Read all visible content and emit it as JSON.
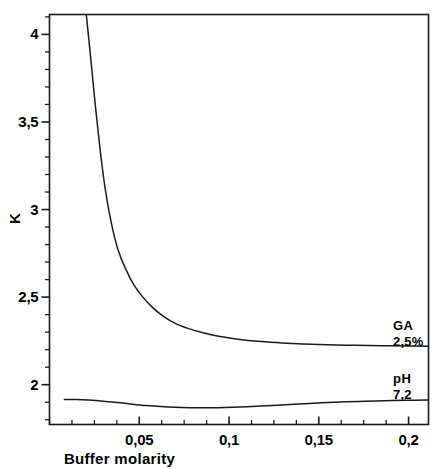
{
  "chart_data": {
    "type": "line",
    "title": "",
    "xlabel": "Buffer molarity",
    "ylabel": "K",
    "xlim": [
      0.0,
      0.2111
    ],
    "ylim": [
      1.7727,
      4.1136
    ],
    "xticks": [
      0.05,
      0.1,
      0.15,
      0.2
    ],
    "xtick_labels": [
      "0,05",
      "0,1",
      "0,15",
      "0,2"
    ],
    "yticks": [
      2,
      2.5,
      3,
      3.5,
      4
    ],
    "ytick_labels": [
      "2",
      "2,5",
      "3",
      "3,5",
      "4"
    ],
    "x_minor_tick_step": 0.0125,
    "y_minor_tick_step": 0.1,
    "grid": false,
    "legend_position": "inline-right-annotations",
    "decimal_separator": ",",
    "frame": "box",
    "line_color": "#1a1a1a",
    "series": [
      {
        "name": "GA 2,5%",
        "annotation_line1": "GA",
        "annotation_line2": "2,5%",
        "x": [
          0.0148,
          0.0165,
          0.0185,
          0.0205,
          0.0225,
          0.025,
          0.028,
          0.031,
          0.0345,
          0.0385,
          0.0425,
          0.047,
          0.052,
          0.0575,
          0.0635,
          0.07,
          0.0775,
          0.086,
          0.095,
          0.105,
          0.116,
          0.128,
          0.141,
          0.155,
          0.17,
          0.185,
          0.2,
          0.2111
        ],
        "y": [
          4.65,
          4.49,
          4.32,
          4.1136,
          3.91,
          3.65,
          3.36,
          3.12,
          2.92,
          2.76,
          2.66,
          2.57,
          2.5,
          2.44,
          2.39,
          2.35,
          2.32,
          2.295,
          2.275,
          2.26,
          2.248,
          2.24,
          2.233,
          2.228,
          2.225,
          2.223,
          2.221,
          2.22
        ]
      },
      {
        "name": "pH 7,2",
        "annotation_line1": "pH",
        "annotation_line2": "7,2",
        "x": [
          0.0083,
          0.015,
          0.022,
          0.03,
          0.038,
          0.046,
          0.054,
          0.062,
          0.07,
          0.078,
          0.086,
          0.094,
          0.102,
          0.11,
          0.118,
          0.127,
          0.136,
          0.145,
          0.155,
          0.165,
          0.176,
          0.187,
          0.198,
          0.2111
        ],
        "y": [
          1.915,
          1.915,
          1.912,
          1.906,
          1.898,
          1.889,
          1.881,
          1.875,
          1.871,
          1.869,
          1.868,
          1.869,
          1.871,
          1.874,
          1.878,
          1.883,
          1.888,
          1.893,
          1.898,
          1.902,
          1.906,
          1.909,
          1.911,
          1.912
        ]
      }
    ]
  }
}
